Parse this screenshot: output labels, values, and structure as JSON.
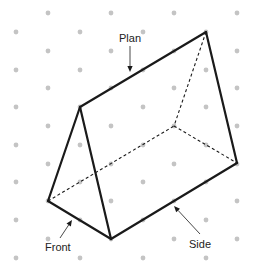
{
  "diagram": {
    "type": "isometric-triangular-prism",
    "colors": {
      "edge": "#1a1a1a",
      "dot": "#c4c4c4",
      "label": "#222222",
      "background": "#ffffff"
    },
    "dot_grid": {
      "rows_y": [
        13,
        32,
        51,
        70,
        88,
        107,
        126,
        145,
        164,
        182,
        201,
        220,
        239,
        258
      ],
      "odd_cols_x": [
        48,
        111,
        174,
        237
      ],
      "even_cols_x": [
        16,
        80,
        143,
        206
      ]
    },
    "vertices": {
      "front_apex": [
        80,
        107
      ],
      "front_left": [
        48,
        201
      ],
      "front_right": [
        111,
        239
      ],
      "back_apex": [
        206,
        32
      ],
      "back_left": [
        174,
        126
      ],
      "back_right": [
        237,
        163
      ]
    },
    "labels": {
      "plan": {
        "text": "Plan",
        "x": 119,
        "y": 42,
        "arrow_from": [
          130,
          46
        ],
        "arrow_to": [
          130,
          72
        ]
      },
      "front": {
        "text": "Front",
        "x": 45,
        "y": 251,
        "arrow_from": [
          60,
          238
        ],
        "arrow_to": [
          72,
          220
        ]
      },
      "side": {
        "text": "Side",
        "x": 189,
        "y": 248,
        "arrow_from": [
          200,
          234
        ],
        "arrow_to": [
          174,
          206
        ]
      }
    }
  }
}
